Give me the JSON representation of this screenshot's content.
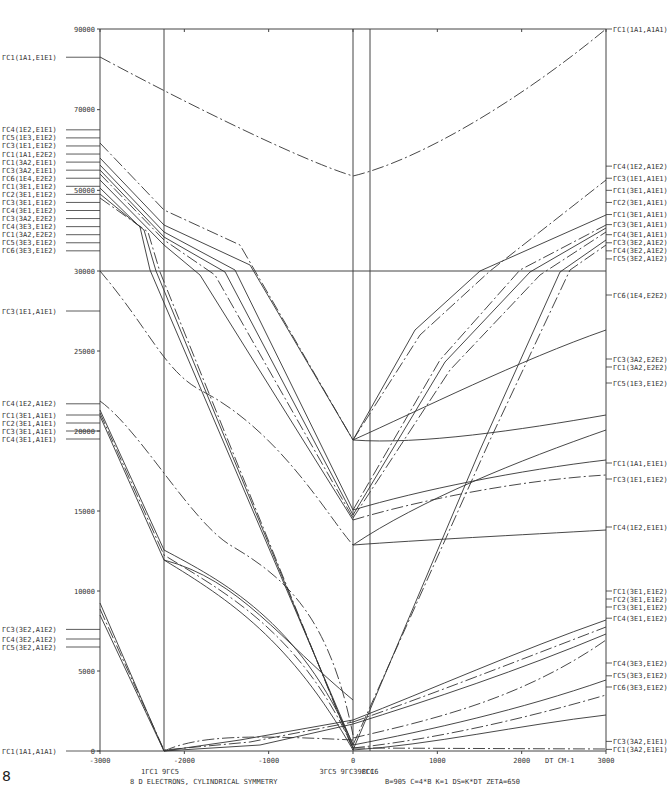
{
  "chart_data": {
    "type": "line",
    "title": "8 D ELECTRONS, CYLINDRICAL SYMMETRY",
    "parameters": "B=905   C=4*B   K=1   DS=K*DT   ZETA=650",
    "xlabel": "DT CM-1",
    "ylabel": "",
    "xlim": [
      -3000,
      3000
    ],
    "ylim": [
      0,
      90000
    ],
    "x_ticks": [
      -3000,
      -2000,
      -1000,
      0,
      1000,
      2000,
      3000
    ],
    "y_ticks": [
      0,
      5000,
      10000,
      15000,
      20000,
      25000,
      30000,
      50000,
      70000,
      90000
    ],
    "y_tick_labels": [
      "0",
      "5000",
      "10000",
      "15000",
      "20000",
      "25000",
      "30000",
      "50000",
      "70000",
      "90000"
    ],
    "y_axis_note": "Axis break at 30000; upper section 30000-90000 compressed",
    "grid": false,
    "vertical_markers": [
      {
        "x": -2200,
        "labels": [
          "1ΓC1",
          "9ΓC5"
        ]
      },
      {
        "x": 0,
        "labels": [
          "3ΓC5",
          "9ΓC3",
          "8ΓC6"
        ]
      },
      {
        "x": 360,
        "labels": [
          "9ΓC1"
        ]
      }
    ],
    "left_labels": [
      {
        "text": "ΓC1(1A1,E1E1)",
        "y": 83000
      },
      {
        "text": "ΓC4(1E2,E1E1)",
        "y": 65000
      },
      {
        "text": "ΓC5(1E3,E1E2)",
        "y": 63000
      },
      {
        "text": "ΓC3(1E1,E1E2)",
        "y": 61000
      },
      {
        "text": "ΓC1(1A1,E2E2)",
        "y": 59000
      },
      {
        "text": "ΓC1(3A2,E1E1)",
        "y": 57000
      },
      {
        "text": "ΓC3(3A2,E1E1)",
        "y": 55000
      },
      {
        "text": "ΓC6(1E4,E2E2)",
        "y": 53000
      },
      {
        "text": "ΓC1(3E1,E1E2)",
        "y": 51000
      },
      {
        "text": "ΓC2(3E1,E1E2)",
        "y": 49000
      },
      {
        "text": "ΓC3(3E1,E1E2)",
        "y": 47000
      },
      {
        "text": "ΓC4(3E1,E1E2)",
        "y": 45000
      },
      {
        "text": "ΓC3(3A2,E2E2)",
        "y": 43000
      },
      {
        "text": "ΓC4(3E3,E1E2)",
        "y": 41000
      },
      {
        "text": "ΓC1(3A2,E2E2)",
        "y": 39000
      },
      {
        "text": "ΓC5(3E3,E1E2)",
        "y": 37000
      },
      {
        "text": "ΓC6(3E3,E1E2)",
        "y": 35000
      },
      {
        "text": "ΓC3(1E1,A1E1)",
        "y": 27500
      },
      {
        "text": "ΓC4(1E2,A1E2)",
        "y": 21700
      },
      {
        "text": "ΓC1(3E1,A1E1)",
        "y": 21000
      },
      {
        "text": "ΓC2(3E1,A1E1)",
        "y": 20500
      },
      {
        "text": "ΓC3(3E1,A1E1)",
        "y": 20000
      },
      {
        "text": "ΓC4(3E1,A1E1)",
        "y": 19500
      },
      {
        "text": "ΓC3(3E2,A1E2)",
        "y": 7600
      },
      {
        "text": "ΓC4(3E2,A1E2)",
        "y": 7000
      },
      {
        "text": "ΓC5(3E2,A1E2)",
        "y": 6500
      },
      {
        "text": "ΓC1(1A1,A1A1)",
        "y": 0
      }
    ],
    "right_labels": [
      {
        "text": "ΓC1(1A1,A1A1)",
        "y": 90000
      },
      {
        "text": "ΓC4(1E2,A1E2)",
        "y": 56000
      },
      {
        "text": "ΓC3(1E1,A1E1)",
        "y": 53000
      },
      {
        "text": "ΓC1(3E1,A1E1)",
        "y": 50000
      },
      {
        "text": "ΓC2(3E1,A1E1)",
        "y": 47000
      },
      {
        "text": "ΓC1(3E1,A1E1)",
        "y": 44000
      },
      {
        "text": "ΓC3(3E1,A1E1)",
        "y": 41500
      },
      {
        "text": "ΓC4(3E1,A1E1)",
        "y": 39000
      },
      {
        "text": "ΓC3(3E2,A1E2)",
        "y": 37000
      },
      {
        "text": "ΓC4(3E2,A1E2)",
        "y": 35000
      },
      {
        "text": "ΓC5(3E2,A1E2)",
        "y": 33000
      },
      {
        "text": "ΓC6(1E4,E2E2)",
        "y": 28500
      },
      {
        "text": "ΓC3(3A2,E2E2)",
        "y": 24500
      },
      {
        "text": "ΓC1(3A2,E2E2)",
        "y": 24000
      },
      {
        "text": "ΓC5(1E3,E1E2)",
        "y": 23000
      },
      {
        "text": "ΓC1(1A1,E1E1)",
        "y": 18000
      },
      {
        "text": "ΓC3(1E1,E1E2)",
        "y": 17000
      },
      {
        "text": "ΓC4(1E2,E1E1)",
        "y": 14000
      },
      {
        "text": "ΓC1(3E1,E1E2)",
        "y": 10000
      },
      {
        "text": "ΓC2(3E1,E1E2)",
        "y": 9500
      },
      {
        "text": "ΓC3(3E1,E1E2)",
        "y": 9000
      },
      {
        "text": "ΓC4(3E1,E1E2)",
        "y": 8300
      },
      {
        "text": "ΓC4(3E3,E1E2)",
        "y": 5500
      },
      {
        "text": "ΓC5(3E3,E1E2)",
        "y": 4700
      },
      {
        "text": "ΓC6(3E3,E1E2)",
        "y": 4000
      },
      {
        "text": "ΓC3(3A2,E1E1)",
        "y": 600
      },
      {
        "text": "ΓC1(3A2,E1E1)",
        "y": 100
      }
    ],
    "series": [
      {
        "name": "ΓC1(1A1,A1A1) high",
        "style": "dash",
        "x": [
          -3000,
          -2000,
          -1000,
          0,
          1000,
          2000,
          3000
        ],
        "y": [
          83000,
          78000,
          72000,
          68000,
          72000,
          80000,
          90000
        ]
      },
      {
        "name": "ΓC1(1A1,A1A1) ground",
        "style": "solid",
        "x": [
          -3000,
          3000
        ],
        "y": [
          0,
          0
        ]
      },
      {
        "name": "ΓC3(1E1,A1E1)",
        "style": "dash",
        "x": [
          -3000,
          -2000,
          -1000,
          0,
          1000,
          2000,
          3000
        ],
        "y": [
          30000,
          22500,
          20500,
          19000,
          19500,
          21000,
          23000
        ]
      },
      {
        "name": "ΓC4(1E2,E1E1)",
        "style": "solid",
        "x": [
          -3000,
          -2000,
          -1000,
          0,
          1000,
          2000,
          3000
        ],
        "y": [
          21700,
          18000,
          15500,
          14300,
          14100,
          14000,
          14000
        ]
      },
      {
        "name": "ΓC3(3E2,A1E2)",
        "style": "solid",
        "x": [
          -3000,
          -2200,
          -1000,
          0,
          1000,
          2000,
          3000
        ],
        "y": [
          7600,
          0,
          900,
          2300,
          5000,
          7000,
          9000
        ]
      },
      {
        "name": "ΓC6(3E3,E1E2)",
        "style": "solid",
        "x": [
          -3000,
          -2200,
          -1000,
          0,
          1000,
          2000,
          3000
        ],
        "y": [
          6500,
          0,
          200,
          0,
          1500,
          2800,
          4000
        ]
      }
    ]
  },
  "corner_mark": "8"
}
